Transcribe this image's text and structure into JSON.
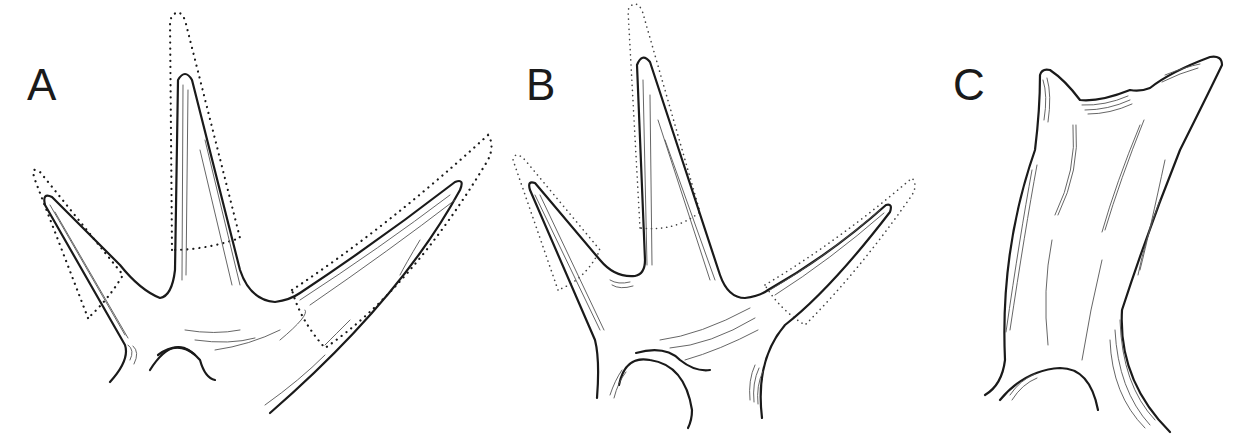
{
  "figure": {
    "panels": [
      {
        "id": "A",
        "label": "A",
        "description": "Antler with three tines; dotted outlines indicate extended tine tips"
      },
      {
        "id": "B",
        "label": "B",
        "description": "Antler with three tines; dotted outlines indicate extended tine tips"
      },
      {
        "id": "C",
        "label": "C",
        "description": "Short palmate antler stub with two small points"
      }
    ],
    "colors": {
      "line": "#1a1a1a",
      "background": "#ffffff"
    }
  }
}
